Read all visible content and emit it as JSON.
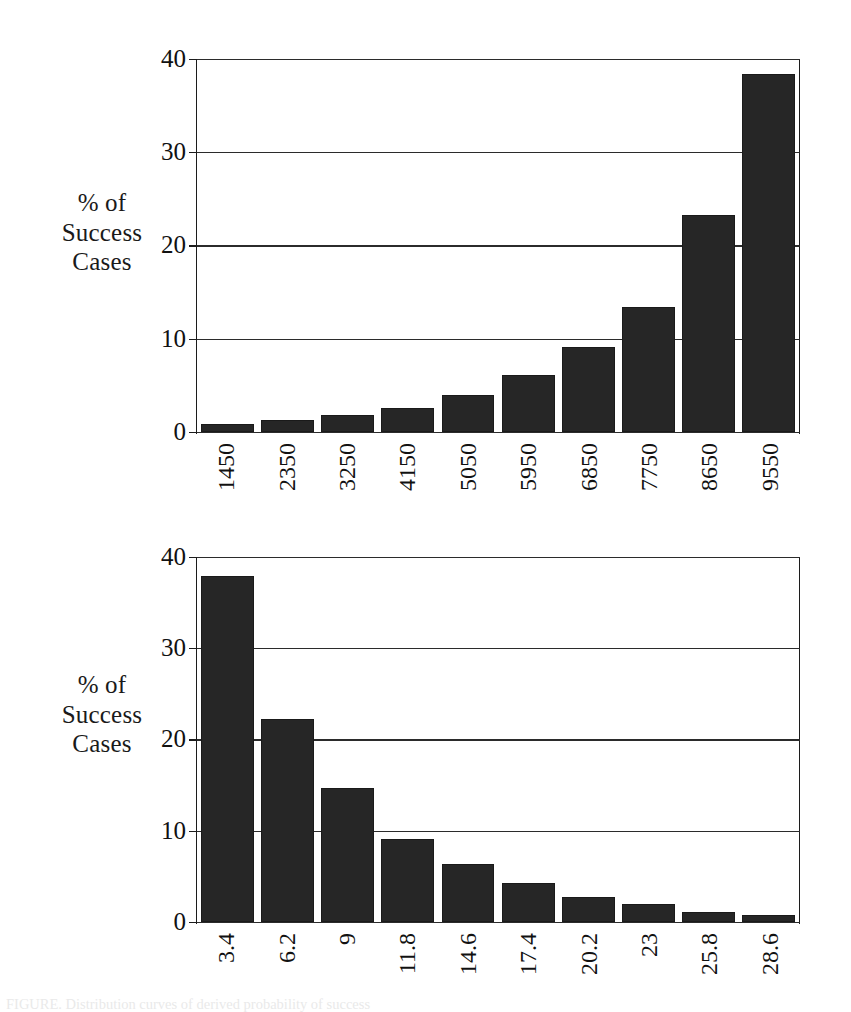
{
  "page": {
    "background": "#ffffff",
    "ink_color": "#1c1c1c",
    "bar_color": "#262626",
    "bottom_caption": "FIGURE.  Distribution curves of derived probability of success"
  },
  "chart_data": [
    {
      "id": "chart-1",
      "type": "bar",
      "title": "",
      "xlabel": "",
      "ylabel": "% of Success Cases",
      "ylabel_lines": [
        "% of",
        "Success",
        "Cases"
      ],
      "categories": [
        "1450",
        "2350",
        "3250",
        "4150",
        "5050",
        "5950",
        "6850",
        "7750",
        "8650",
        "9550"
      ],
      "values": [
        0.8,
        1.3,
        1.8,
        2.5,
        3.9,
        6.1,
        9.1,
        13.4,
        23.3,
        38.5
      ],
      "ylim": [
        0,
        40
      ],
      "yticks": [
        0,
        10,
        20,
        30,
        40
      ],
      "ytick_labels": [
        "0",
        "10",
        "20",
        "30",
        "40"
      ],
      "grid": true,
      "legend": "none",
      "xtick_rotation": -90
    },
    {
      "id": "chart-2",
      "type": "bar",
      "title": "",
      "xlabel": "",
      "ylabel": "% of Success Cases",
      "ylabel_lines": [
        "% of",
        "Success",
        "Cases"
      ],
      "categories": [
        "3.4",
        "6.2",
        "9",
        "11.8",
        "14.6",
        "17.4",
        "20.2",
        "23",
        "25.8",
        "28.6"
      ],
      "values": [
        38.0,
        22.3,
        14.7,
        9.1,
        6.3,
        4.2,
        2.7,
        1.9,
        1.1,
        0.7
      ],
      "ylim": [
        0,
        40
      ],
      "yticks": [
        0,
        10,
        20,
        30,
        40
      ],
      "ytick_labels": [
        "0",
        "10",
        "20",
        "30",
        "40"
      ],
      "grid": true,
      "legend": "none",
      "xtick_rotation": -90
    }
  ]
}
